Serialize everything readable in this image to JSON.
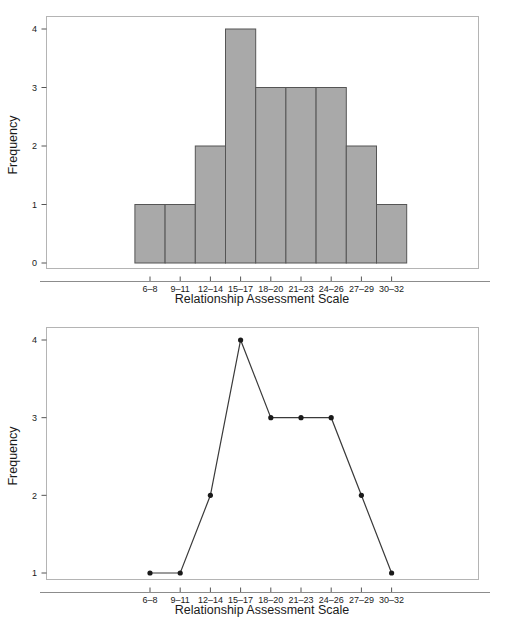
{
  "figures": [
    {
      "id": "histogram",
      "name": "histogram-chart",
      "xlabel": "Relationship Assessment Scale",
      "ylabel": "Frequency",
      "y_ticks": [
        "0",
        "1",
        "2",
        "3",
        "4"
      ],
      "x_ticks": [
        "6–8",
        "9–11",
        "12–14",
        "15–17",
        "18–20",
        "21–23",
        "24–26",
        "27–29",
        "30–32"
      ]
    },
    {
      "id": "frequency-polygon",
      "name": "frequency-polygon-chart",
      "xlabel": "Relationship Assessment Scale",
      "ylabel": "Frequency",
      "y_ticks": [
        "1",
        "2",
        "3",
        "4"
      ],
      "x_ticks": [
        "6–8",
        "9–11",
        "12–14",
        "15–17",
        "18–20",
        "21–23",
        "24–26",
        "27–29",
        "30–32"
      ]
    }
  ],
  "style": {
    "bar_fill": "#a9a9a9",
    "bar_stroke": "#555555",
    "frame_stroke": "#b4b4b4",
    "line_stroke": "#3a3a3a",
    "marker_fill": "#1a1a1a",
    "background": "#ffffff"
  },
  "chart_data": [
    {
      "type": "bar",
      "title": "",
      "xlabel": "Relationship Assessment Scale",
      "ylabel": "Frequency",
      "categories": [
        "6–8",
        "9–11",
        "12–14",
        "15–17",
        "18–20",
        "21–23",
        "24–26",
        "27–29",
        "30–32"
      ],
      "values": [
        1,
        1,
        2,
        4,
        3,
        3,
        3,
        2,
        1
      ],
      "ylim": [
        0,
        4
      ],
      "yticks": [
        0,
        1,
        2,
        3,
        4
      ],
      "grid": false,
      "legend": false,
      "bar_gap": 0,
      "notes": "Histogram of Relationship Assessment Scale scores; adjacent bars touch."
    },
    {
      "type": "line",
      "title": "",
      "xlabel": "Relationship Assessment Scale",
      "ylabel": "Frequency",
      "categories": [
        "6–8",
        "9–11",
        "12–14",
        "15–17",
        "18–20",
        "21–23",
        "24–26",
        "27–29",
        "30–32"
      ],
      "values": [
        1,
        1,
        2,
        4,
        3,
        3,
        3,
        2,
        1
      ],
      "ylim": [
        1,
        4
      ],
      "yticks": [
        1,
        2,
        3,
        4
      ],
      "grid": false,
      "legend": false,
      "markers": "filled-circle",
      "notes": "Frequency polygon of the same distribution; y-axis begins at 1."
    }
  ]
}
